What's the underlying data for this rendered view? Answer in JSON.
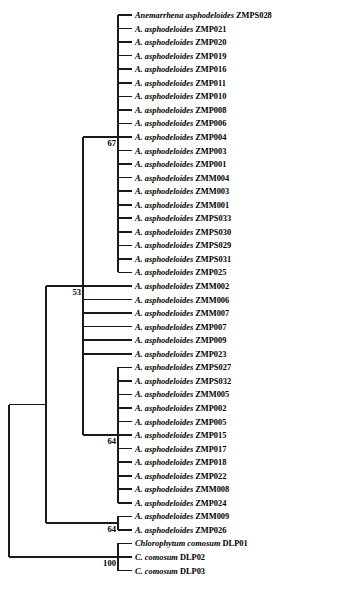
{
  "figure": {
    "kind": "phylogenetic-tree",
    "orientation": "left-to-right-rectangular",
    "line_color": "#1a1a1a",
    "background_color": "#ffffff"
  },
  "tips": [
    {
      "id": "t1",
      "genus": "Anemarrhena asphodeloides",
      "code": "ZMPS028",
      "y": 15
    },
    {
      "id": "t2",
      "genus": "A. asphodeloides",
      "code": "ZMP021",
      "y": 30
    },
    {
      "id": "t3",
      "genus": "A. asphodeloides",
      "code": "ZMP020",
      "y": 45
    },
    {
      "id": "t4",
      "genus": "A. asphodeloides",
      "code": "ZMP019",
      "y": 60
    },
    {
      "id": "t5",
      "genus": "A. asphodeloides",
      "code": "ZMP016",
      "y": 75
    },
    {
      "id": "t6",
      "genus": "A. asphodeloides",
      "code": "ZMP011",
      "y": 90
    },
    {
      "id": "t7",
      "genus": "A. asphodeloides",
      "code": "ZMP010",
      "y": 105
    },
    {
      "id": "t8",
      "genus": "A. asphodeloides",
      "code": "ZMP008",
      "y": 120
    },
    {
      "id": "t9",
      "genus": "A. asphodeloides",
      "code": "ZMP006",
      "y": 135
    },
    {
      "id": "t10",
      "genus": "A. asphodeloides",
      "code": "ZMP004",
      "y": 150
    },
    {
      "id": "t11",
      "genus": "A. asphodeloides",
      "code": "ZMP003",
      "y": 165
    },
    {
      "id": "t12",
      "genus": "A. asphodeloides",
      "code": "ZMP001",
      "y": 180
    },
    {
      "id": "t13",
      "genus": "A. asphodeloides",
      "code": "ZMM004",
      "y": 195
    },
    {
      "id": "t14",
      "genus": "A. asphodeloides",
      "code": "ZMM003",
      "y": 210
    },
    {
      "id": "t15",
      "genus": "A. asphodeloides",
      "code": "ZMM001",
      "y": 225
    },
    {
      "id": "t16",
      "genus": "A. asphodeloides",
      "code": "ZMPS033",
      "y": 240
    },
    {
      "id": "t17",
      "genus": "A. asphodeloides",
      "code": "ZMPS030",
      "y": 255
    },
    {
      "id": "t18",
      "genus": "A. asphodeloides",
      "code": "ZMPS029",
      "y": 270
    },
    {
      "id": "t19",
      "genus": "A. asphodeloides",
      "code": "ZMPS031",
      "y": 285
    },
    {
      "id": "t20",
      "genus": "A. asphodeloides",
      "code": "ZMP025",
      "y": 300
    },
    {
      "id": "t21",
      "genus": "A. asphodeloides",
      "code": "ZMM002",
      "y": 315
    },
    {
      "id": "t22",
      "genus": "A. asphodeloides",
      "code": "ZMM006",
      "y": 330
    },
    {
      "id": "t23",
      "genus": "A. asphodeloides",
      "code": "ZMM007",
      "y": 345
    },
    {
      "id": "t24",
      "genus": "A. asphodeloides",
      "code": "ZMP007",
      "y": 360
    },
    {
      "id": "t25",
      "genus": "A. asphodeloides",
      "code": "ZMP009",
      "y": 375
    },
    {
      "id": "t26",
      "genus": "A. asphodeloides",
      "code": "ZMP023",
      "y": 390
    },
    {
      "id": "t27",
      "genus": "A. asphodeloides",
      "code": "ZMPS027",
      "y": 405
    },
    {
      "id": "t28",
      "genus": "A. asphodeloides",
      "code": "ZMPS032",
      "y": 420
    },
    {
      "id": "t29",
      "genus": "A. asphodeloides",
      "code": "ZMM005",
      "y": 435
    },
    {
      "id": "t30",
      "genus": "A. asphodeloides",
      "code": "ZMP002",
      "y": 450
    },
    {
      "id": "t31",
      "genus": "A. asphodeloides",
      "code": "ZMP005",
      "y": 465
    },
    {
      "id": "t32",
      "genus": "A. asphodeloides",
      "code": "ZMP015",
      "y": 480
    },
    {
      "id": "t33",
      "genus": "A. asphodeloides",
      "code": "ZMP017",
      "y": 495
    },
    {
      "id": "t34",
      "genus": "A. asphodeloides",
      "code": "ZMP018",
      "y": 510
    },
    {
      "id": "t35",
      "genus": "A. asphodeloides",
      "code": "ZMP022",
      "y": 525
    },
    {
      "id": "t36",
      "genus": "A. asphodeloides",
      "code": "ZMM008",
      "y": 540
    },
    {
      "id": "t37",
      "genus": "A. asphodeloides",
      "code": "ZMP024",
      "y": 555
    },
    {
      "id": "t38",
      "genus": "A. asphodeloides",
      "code": "ZMM009",
      "y": 570
    },
    {
      "id": "t39",
      "genus": "A. asphodeloides",
      "code": "ZMP026",
      "y": 585
    },
    {
      "id": "t40",
      "genus": "Chlorophytum comosum",
      "code": "DLP01",
      "y": 600
    },
    {
      "id": "t41",
      "genus": "C. comosum",
      "code": "DLP02",
      "y": 615
    },
    {
      "id": "t42",
      "genus": "C. comosum",
      "code": "DLP03",
      "y": 630
    }
  ],
  "bootstrap_labels": [
    {
      "id": "b67",
      "value": "67",
      "x": 116,
      "y": 137
    },
    {
      "id": "b53",
      "value": "53",
      "x": 81,
      "y": 283
    },
    {
      "id": "b64a",
      "value": "64",
      "x": 116,
      "y": 443
    },
    {
      "id": "b64b",
      "value": "64",
      "x": 116,
      "y": 538
    },
    {
      "id": "b100",
      "value": "100",
      "x": 116,
      "y": 574
    }
  ]
}
